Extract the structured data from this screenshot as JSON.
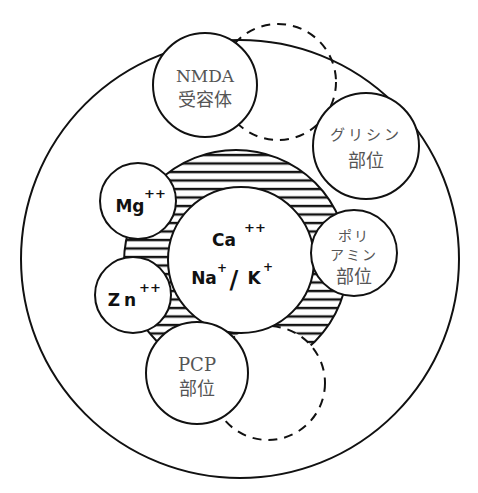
{
  "diagram": {
    "colors": {
      "stroke": "#111111",
      "label_jp": "#555555",
      "label_ion": "#111111",
      "background": "#ffffff"
    },
    "sites": {
      "nmda": {
        "line1": "NMDA",
        "line2": "受容体"
      },
      "glycine": {
        "line1": "グリシン",
        "line2": "部位"
      },
      "polyamine": {
        "line1": "ポリ",
        "line2": "アミン",
        "line3": "部位"
      },
      "pcp": {
        "line1": "PCP",
        "line2": "部位"
      },
      "mg": {
        "ion": "Mg",
        "charge": "++"
      },
      "zn": {
        "ion": "Zn",
        "charge": "++"
      },
      "channel": {
        "ion1": "Ca",
        "ion1_charge": "++",
        "ion2": "Na",
        "ion2_charge": "+",
        "separator": "/",
        "ion3": "K",
        "ion3_charge": "+"
      }
    },
    "shapes": {
      "outer_membrane": {
        "cx": 240,
        "cy": 259,
        "r": 219
      },
      "channel_pore_hatched": {
        "cx": 236,
        "cy": 262,
        "r": 112
      },
      "channel_center": {
        "cx": 241,
        "cy": 260,
        "r": 73
      },
      "nmda_circle": {
        "cx": 205,
        "cy": 85,
        "r": 52
      },
      "nmda_dashed_alt": {
        "cx": 278,
        "cy": 82,
        "r": 58
      },
      "glycine_circle": {
        "cx": 366,
        "cy": 146,
        "r": 53
      },
      "polyamine_circle": {
        "cx": 354,
        "cy": 253,
        "r": 43
      },
      "mg_circle": {
        "cx": 138,
        "cy": 201,
        "r": 38
      },
      "zn_circle": {
        "cx": 133,
        "cy": 295,
        "r": 38
      },
      "pcp_circle": {
        "cx": 197,
        "cy": 373,
        "r": 51
      },
      "pcp_dashed_alt": {
        "cx": 268,
        "cy": 383,
        "r": 57
      }
    }
  }
}
